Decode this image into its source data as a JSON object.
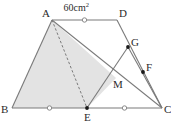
{
  "figure": {
    "area_annotation": {
      "value": "60",
      "unit": "cm",
      "exponent": "2",
      "text": "60cm"
    },
    "colors": {
      "stroke": "#7a7a7a",
      "label": "#2b2b2b",
      "shade_fill": "#e3e3e3",
      "background": "#ffffff",
      "point_dot": "#1a1a1a",
      "tick_mark": "#8a8a8a"
    },
    "points": [
      {
        "id": "A",
        "label": "A",
        "x": 52,
        "y": 20,
        "dot": false,
        "label_dx": -10,
        "label_dy": -12
      },
      {
        "id": "B",
        "label": "B",
        "x": 12,
        "y": 108,
        "dot": false,
        "label_dx": -11,
        "label_dy": -4
      },
      {
        "id": "C",
        "label": "C",
        "x": 162,
        "y": 108,
        "dot": false,
        "label_dx": 2,
        "label_dy": -4
      },
      {
        "id": "D",
        "label": "D",
        "x": 117,
        "y": 20,
        "dot": false,
        "label_dx": 2,
        "label_dy": -12
      },
      {
        "id": "E",
        "label": "E",
        "x": 87,
        "y": 108,
        "dot": true,
        "label_dx": -3,
        "label_dy": 4
      },
      {
        "id": "F",
        "label": "F",
        "x": 143,
        "y": 72,
        "dot": true,
        "label_dx": 3,
        "label_dy": -10
      },
      {
        "id": "G",
        "label": "G",
        "x": 128,
        "y": 47,
        "dot": true,
        "label_dx": 3,
        "label_dy": -10
      },
      {
        "id": "M",
        "label": "M",
        "x": 116,
        "y": 78,
        "dot": false,
        "label_dx": -3,
        "label_dy": 1
      }
    ],
    "segments": [
      {
        "id": "AB",
        "from": "A",
        "to": "B",
        "style": "solid"
      },
      {
        "id": "BC",
        "from": "B",
        "to": "C",
        "style": "solid"
      },
      {
        "id": "AD",
        "from": "A",
        "to": "D",
        "style": "solid"
      },
      {
        "id": "DC",
        "from": "D",
        "to": "C",
        "style": "solid"
      },
      {
        "id": "AC",
        "from": "A",
        "to": "C",
        "style": "solid"
      },
      {
        "id": "AE",
        "from": "A",
        "to": "E",
        "style": "dashed"
      },
      {
        "id": "EG",
        "from": "E",
        "to": "G",
        "style": "solid"
      },
      {
        "id": "GC",
        "from": "G",
        "to": "C",
        "style": "solid"
      }
    ],
    "shaded_region": {
      "id": "shaded-quad-ABEM",
      "vertices": [
        "A",
        "B",
        "E",
        "M"
      ]
    },
    "tick_marks": [
      {
        "id": "tick-AD",
        "on": "AD",
        "shape": "circle"
      },
      {
        "id": "tick-BE",
        "on": "BE",
        "shape": "circle"
      },
      {
        "id": "tick-EC",
        "on": "EC",
        "shape": "circle"
      }
    ]
  }
}
